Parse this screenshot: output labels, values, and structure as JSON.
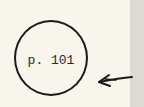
{
  "document": {
    "page_reference": "p. 101",
    "annotation": {
      "shape": "circle",
      "pointer": "left-arrow"
    }
  },
  "colors": {
    "paper": "#f7f5ec",
    "margin_strip": "#dcdad2",
    "ink": "#1a1a1a"
  }
}
